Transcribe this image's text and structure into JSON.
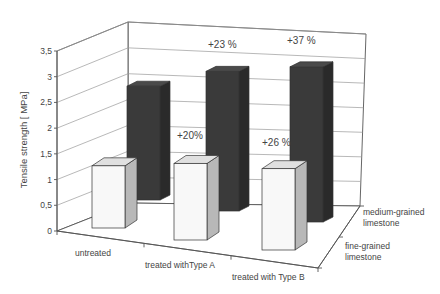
{
  "chart_data": {
    "type": "bar",
    "subtype": "3d-column",
    "title": "",
    "ylabel": "Tensile strength [ MPa]",
    "xlabel": "",
    "ylim": [
      0,
      3.5
    ],
    "yticks": [
      "0",
      "0,5",
      "1",
      "1,5",
      "2",
      "2,5",
      "3",
      "3,5"
    ],
    "grid": true,
    "legend": "none (series labeled on depth axis)",
    "categories": [
      "untreated",
      "treated withType A",
      "treated with Type B"
    ],
    "series": [
      {
        "name": "fine-grained limestone",
        "name_lines": [
          "fine-grained",
          "limestone"
        ],
        "color": "#f8f8f8",
        "values": [
          1.3,
          1.6,
          1.7
        ],
        "annotations": [
          "",
          "+20%",
          "+26 %"
        ]
      },
      {
        "name": "medium-grained limestone",
        "name_lines": [
          "medium-grained",
          "limestone"
        ],
        "color": "#3a3a3a",
        "values": [
          2.2,
          2.7,
          3.0
        ],
        "annotations": [
          "",
          "+23 %",
          "+37 %"
        ]
      }
    ]
  }
}
